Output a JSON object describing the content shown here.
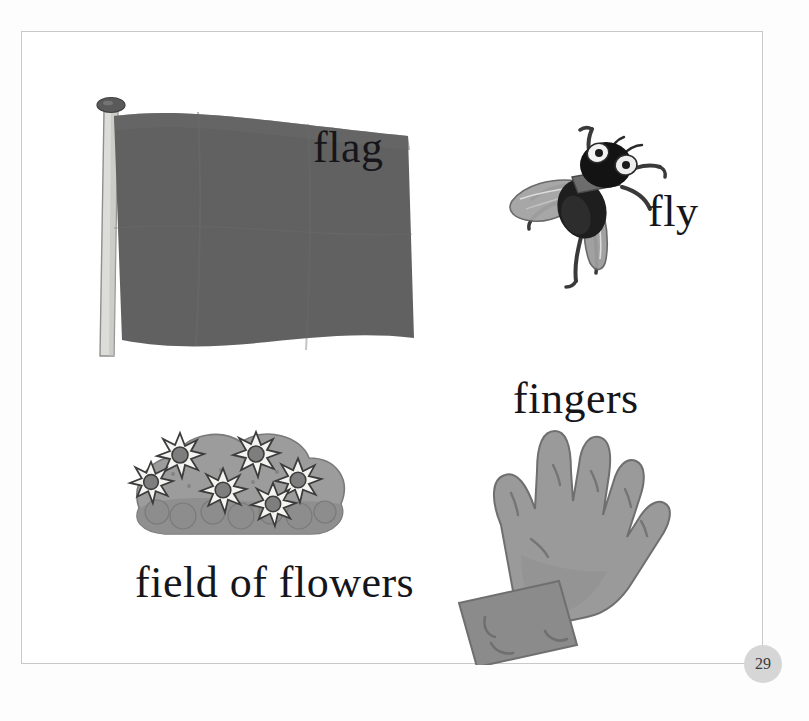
{
  "page": {
    "number": "29",
    "background_color": "#fdfdfd",
    "border_color": "#c9c9c9",
    "badge_color": "#d6d6d6"
  },
  "items": [
    {
      "id": "flag",
      "label": "flag",
      "icon": "flag-illustration",
      "colors": {
        "cloth": "#616161",
        "pole": "#d9d9d5",
        "finial": "#555555"
      }
    },
    {
      "id": "fly",
      "label": "fly",
      "icon": "fly-illustration",
      "colors": {
        "body": "#1c1c1c",
        "wing": "#9a9a9a",
        "eye": "#efefef",
        "leg": "#3a3a3a"
      }
    },
    {
      "id": "fingers",
      "label": "fingers",
      "icon": "hand-illustration",
      "colors": {
        "skin": "#989898",
        "sleeve": "#8b8b8b",
        "outline": "#6f6f6f"
      }
    },
    {
      "id": "field_of_flowers",
      "label": "field of flowers",
      "icon": "flowers-illustration",
      "colors": {
        "bush": "#9a9a9a",
        "bush_dark": "#8a8a8a",
        "petal": "#f3f3f0",
        "center": "#7e7e7e",
        "outline": "#3c3c3c"
      }
    }
  ]
}
